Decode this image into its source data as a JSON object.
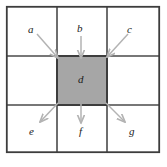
{
  "figure": {
    "grid": {
      "rows": 3,
      "cols": 3,
      "outer_border_color": "#3d3d3d",
      "inner_line_color": "#4a4a4a",
      "cell_fill_color": "#ffffff",
      "highlight_fill_color": "#a6a6a6",
      "highlight_border_color": "#3d3d3d",
      "highlight_cell": "center"
    },
    "arrow_color": "#b3b3b3"
  },
  "labels": {
    "a": "a",
    "b": "b",
    "c": "c",
    "d": "d",
    "e": "e",
    "f": "f",
    "g": "g"
  },
  "arrows": [
    {
      "name": "arrow-a-to-d",
      "from": "a",
      "to": "d",
      "direction": "down-right"
    },
    {
      "name": "arrow-b-to-d",
      "from": "b",
      "to": "d",
      "direction": "down"
    },
    {
      "name": "arrow-c-to-d",
      "from": "c",
      "to": "d",
      "direction": "down-left"
    },
    {
      "name": "arrow-d-to-e",
      "from": "d",
      "to": "e",
      "direction": "down-left"
    },
    {
      "name": "arrow-d-to-f",
      "from": "d",
      "to": "f",
      "direction": "down"
    },
    {
      "name": "arrow-d-to-g",
      "from": "d",
      "to": "g",
      "direction": "down-right"
    }
  ]
}
